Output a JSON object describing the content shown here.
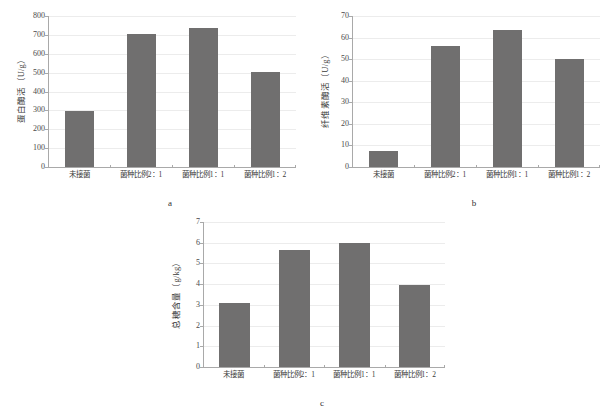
{
  "figure": {
    "background": "#ffffff",
    "bar_color": "#706f6f",
    "grid_color": "#ececec",
    "axis_color": "#a9a9a9"
  },
  "panels": [
    {
      "letter": "a",
      "ytitle": "蛋白酶活（U/g）",
      "yticks": [
        "0",
        "100",
        "200",
        "300",
        "400",
        "500",
        "600",
        "700",
        "800"
      ],
      "xlabels": [
        "未接菌",
        "菌种比例2：1",
        "菌种比例1：1",
        "菌种比例1：2"
      ]
    },
    {
      "letter": "b",
      "ytitle": "纤维素酶活（U/g）",
      "yticks": [
        "0",
        "10",
        "20",
        "30",
        "40",
        "50",
        "60",
        "70"
      ],
      "xlabels": [
        "未接菌",
        "菌种比例2：1",
        "菌种比例1：1",
        "菌种比例1：2"
      ]
    },
    {
      "letter": "c",
      "ytitle": "总糖含量（g/kg）",
      "yticks": [
        "0",
        "1",
        "2",
        "3",
        "4",
        "5",
        "6",
        "7"
      ],
      "xlabels": [
        "未接菌",
        "菌种比例2：1",
        "菌种比例1：1",
        "菌种比例1：2"
      ]
    }
  ],
  "chart_data": [
    {
      "type": "bar",
      "panel": "a",
      "title": "",
      "xlabel": "",
      "ylabel": "蛋白酶活（U/g）",
      "categories": [
        "未接菌",
        "菌种比例2：1",
        "菌种比例1：1",
        "菌种比例1：2"
      ],
      "values": [
        298,
        706,
        738,
        505
      ],
      "ylim": [
        0,
        800
      ],
      "ytick_step": 100,
      "grid": true,
      "legend": "none"
    },
    {
      "type": "bar",
      "panel": "b",
      "title": "",
      "xlabel": "",
      "ylabel": "纤维素酶活（U/g）",
      "categories": [
        "未接菌",
        "菌种比例2：1",
        "菌种比例1：1",
        "菌种比例1：2"
      ],
      "values": [
        7.5,
        56,
        63.5,
        50
      ],
      "ylim": [
        0,
        70
      ],
      "ytick_step": 10,
      "grid": true,
      "legend": "none"
    },
    {
      "type": "bar",
      "panel": "c",
      "title": "",
      "xlabel": "",
      "ylabel": "总糖含量（g/kg）",
      "categories": [
        "未接菌",
        "菌种比例2：1",
        "菌种比例1：1",
        "菌种比例1：2"
      ],
      "values": [
        3.1,
        5.65,
        6.0,
        3.95
      ],
      "ylim": [
        0,
        7
      ],
      "ytick_step": 1,
      "grid": true,
      "legend": "none"
    }
  ]
}
